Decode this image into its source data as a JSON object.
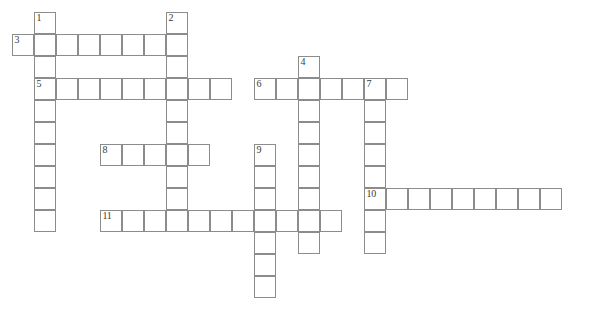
{
  "puzzle": {
    "title": "",
    "type": "crossword-grid",
    "cell_size": 22,
    "grid_origin": {
      "x": 12,
      "y": 12
    },
    "colors": {
      "cell_border": "#8c8c8c",
      "cell_fill": "#ffffff",
      "number_text": "#3a3a3a",
      "page_background": "#ffffff"
    },
    "entries": [
      {
        "number": "1",
        "direction": "down",
        "col": 1,
        "row": 0,
        "length": 10
      },
      {
        "number": "2",
        "direction": "down",
        "col": 7,
        "row": 0,
        "length": 10
      },
      {
        "number": "3",
        "direction": "across",
        "col": 0,
        "row": 1,
        "length": 8
      },
      {
        "number": "4",
        "direction": "down",
        "col": 13,
        "row": 2,
        "length": 9
      },
      {
        "number": "5",
        "direction": "across",
        "col": 1,
        "row": 3,
        "length": 9
      },
      {
        "number": "6",
        "direction": "across",
        "col": 11,
        "row": 3,
        "length": 7
      },
      {
        "number": "7",
        "direction": "down",
        "col": 16,
        "row": 3,
        "length": 8
      },
      {
        "number": "8",
        "direction": "across",
        "col": 4,
        "row": 6,
        "length": 5
      },
      {
        "number": "9",
        "direction": "down",
        "col": 11,
        "row": 6,
        "length": 7
      },
      {
        "number": "10",
        "direction": "across",
        "col": 16,
        "row": 8,
        "length": 9
      },
      {
        "number": "11",
        "direction": "across",
        "col": 4,
        "row": 9,
        "length": 11
      }
    ],
    "numbered_cells": [
      {
        "label": "1",
        "col": 1,
        "row": 0
      },
      {
        "label": "2",
        "col": 7,
        "row": 0
      },
      {
        "label": "3",
        "col": 0,
        "row": 1
      },
      {
        "label": "4",
        "col": 13,
        "row": 2
      },
      {
        "label": "5",
        "col": 1,
        "row": 3
      },
      {
        "label": "6",
        "col": 11,
        "row": 3
      },
      {
        "label": "7",
        "col": 16,
        "row": 3
      },
      {
        "label": "8",
        "col": 4,
        "row": 6
      },
      {
        "label": "9",
        "col": 11,
        "row": 6
      },
      {
        "label": "10",
        "col": 16,
        "row": 8
      },
      {
        "label": "11",
        "col": 4,
        "row": 9
      }
    ]
  }
}
